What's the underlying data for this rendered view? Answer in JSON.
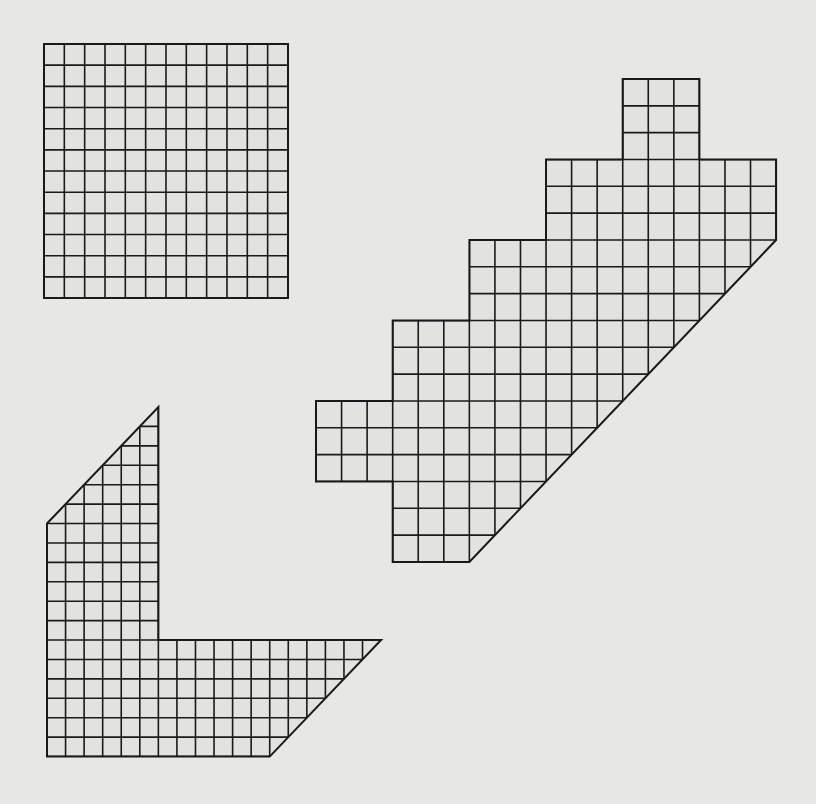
{
  "page": {
    "background": "#e7e7e5",
    "line_color": "#1a1a1a",
    "fill_color": "#e2e2e0"
  },
  "figures": [
    {
      "name": "square-grid",
      "description": "12 x 12 square grid",
      "origin": [
        44,
        44
      ],
      "cell": [
        20.33,
        21.17
      ],
      "cols": 12,
      "rows": 12,
      "outline": [
        [
          0,
          0
        ],
        [
          12,
          0
        ],
        [
          12,
          12
        ],
        [
          0,
          12
        ]
      ]
    },
    {
      "name": "staircase-grid",
      "description": "Stepped grid shape with top tab, left tab and 45-degree diagonal edge",
      "origin": [
        316,
        79
      ],
      "cell": [
        25.56,
        26.83
      ],
      "cols": 18,
      "rows": 18,
      "outline": [
        [
          12,
          0
        ],
        [
          15,
          0
        ],
        [
          15,
          3
        ],
        [
          18,
          3
        ],
        [
          18,
          6
        ],
        [
          6,
          18
        ],
        [
          3,
          18
        ],
        [
          3,
          15
        ],
        [
          0,
          15
        ],
        [
          0,
          12
        ],
        [
          3,
          12
        ],
        [
          3,
          9
        ],
        [
          6,
          9
        ],
        [
          6,
          6
        ],
        [
          9,
          6
        ],
        [
          9,
          3
        ],
        [
          12,
          3
        ]
      ]
    },
    {
      "name": "l-shape-grid",
      "description": "L-shaped grid with diagonal top and diagonal right end",
      "origin": [
        47,
        407
      ],
      "cell": [
        18.56,
        19.42
      ],
      "cols": 18,
      "rows": 18,
      "outline": [
        [
          6,
          0
        ],
        [
          6,
          12
        ],
        [
          18,
          12
        ],
        [
          12,
          18
        ],
        [
          0,
          18
        ],
        [
          0,
          6
        ]
      ]
    }
  ]
}
